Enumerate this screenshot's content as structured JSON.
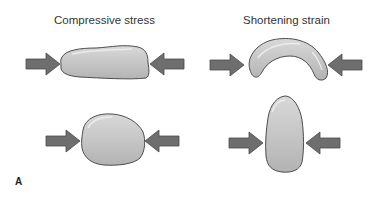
{
  "figure": {
    "panel_label": "A",
    "columns": [
      {
        "title": "Compressive stress"
      },
      {
        "title": "Shortening strain"
      }
    ],
    "rows": [
      {
        "left": "flattened-block",
        "right": "bent-arch"
      },
      {
        "left": "rounded-block",
        "right": "elongated-oval"
      }
    ],
    "colors": {
      "arrow_fill": "#6e6e6e",
      "arrow_stroke": "#4a4a4a",
      "body_fill": "#c4c4c4",
      "body_stroke": "#4d4d4d",
      "highlight": "#e8e8e8"
    }
  }
}
